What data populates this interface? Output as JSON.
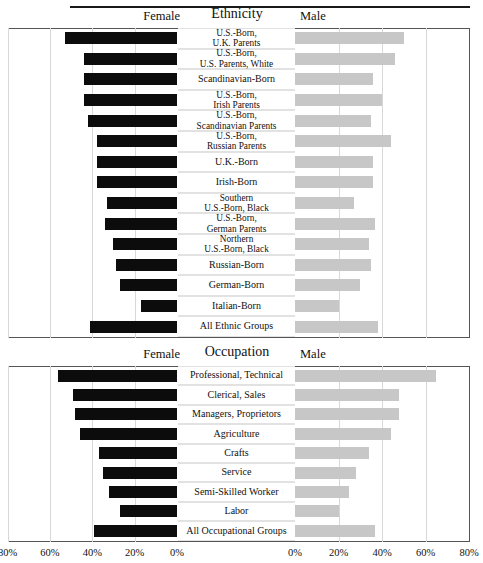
{
  "figure": {
    "top_rule": true
  },
  "charts": [
    {
      "id": "ethnicity",
      "header_left": "Female",
      "header_center": "Ethnicity",
      "header_right": "Male",
      "categories": [
        "U.S.-Born,|U.K. Parents",
        "U.S.-Born,|U.S. Parents, White",
        "Scandinavian-Born",
        "U.S.-Born,|Irish Parents",
        "U.S.-Born,|Scandinavian Parents",
        "U.S.-Born,|Russian Parents",
        "U.K.-Born",
        "Irish-Born",
        "Southern|U.S.-Born, Black",
        "U.S.-Born,|German Parents",
        "Northern|U.S.-Born, Black",
        "Russian-Born",
        "German-Born",
        "Italian-Born",
        "All Ethnic Groups"
      ],
      "female": [
        53,
        44,
        44,
        44,
        42,
        38,
        38,
        38,
        33,
        34,
        30,
        29,
        27,
        17,
        41
      ],
      "male": [
        50,
        46,
        36,
        40,
        35,
        44,
        36,
        36,
        27,
        37,
        34,
        35,
        30,
        20,
        38
      ]
    },
    {
      "id": "occupation",
      "header_left": "Female",
      "header_center": "Occupation",
      "header_right": "Male",
      "categories": [
        "Professional, Technical",
        "Clerical, Sales",
        "Managers, Proprietors",
        "Agriculture",
        "Crafts",
        "Service",
        "Semi-Skilled Worker",
        "Labor",
        "All Occupational Groups"
      ],
      "female": [
        56,
        49,
        48,
        46,
        37,
        35,
        32,
        27,
        39
      ],
      "male": [
        65,
        48,
        48,
        44,
        34,
        28,
        25,
        20,
        37
      ]
    }
  ],
  "axis": {
    "left_ticks": [
      "80%",
      "60%",
      "40%",
      "20%",
      "0%"
    ],
    "right_ticks": [
      "0%",
      "20%",
      "40%",
      "60%",
      "80%"
    ]
  },
  "chart_data": {
    "type": "bar",
    "title": "",
    "subtype": "paired horizontal population pyramid (two stacked panels)",
    "xlabel": "",
    "ylabel": "",
    "xlim": [
      0,
      80
    ],
    "grid": true,
    "legend": [
      "Female",
      "Male"
    ],
    "legend_position": "top",
    "panels": [
      {
        "name": "Ethnicity",
        "categories": [
          "U.S.-Born, U.K. Parents",
          "U.S.-Born, U.S. Parents, White",
          "Scandinavian-Born",
          "U.S.-Born, Irish Parents",
          "U.S.-Born, Scandinavian Parents",
          "U.S.-Born, Russian Parents",
          "U.K.-Born",
          "Irish-Born",
          "Southern U.S.-Born, Black",
          "U.S.-Born, German Parents",
          "Northern U.S.-Born, Black",
          "Russian-Born",
          "German-Born",
          "Italian-Born",
          "All Ethnic Groups"
        ],
        "series": [
          {
            "name": "Female",
            "values": [
              53,
              44,
              44,
              44,
              42,
              38,
              38,
              38,
              33,
              34,
              30,
              29,
              27,
              17,
              41
            ]
          },
          {
            "name": "Male",
            "values": [
              50,
              46,
              36,
              40,
              35,
              44,
              36,
              36,
              27,
              37,
              34,
              35,
              30,
              20,
              38
            ]
          }
        ]
      },
      {
        "name": "Occupation",
        "categories": [
          "Professional, Technical",
          "Clerical, Sales",
          "Managers, Proprietors",
          "Agriculture",
          "Crafts",
          "Service",
          "Semi-Skilled Worker",
          "Labor",
          "All Occupational Groups"
        ],
        "series": [
          {
            "name": "Female",
            "values": [
              56,
              49,
              48,
              46,
              37,
              35,
              32,
              27,
              39
            ]
          },
          {
            "name": "Male",
            "values": [
              65,
              48,
              48,
              44,
              34,
              28,
              25,
              20,
              37
            ]
          }
        ]
      }
    ],
    "tick_labels_left": [
      "80%",
      "60%",
      "40%",
      "20%",
      "0%"
    ],
    "tick_labels_right": [
      "0%",
      "20%",
      "40%",
      "60%",
      "80%"
    ],
    "colors": {
      "female": "#0c0c0c",
      "male": "#c7c7c7"
    }
  }
}
